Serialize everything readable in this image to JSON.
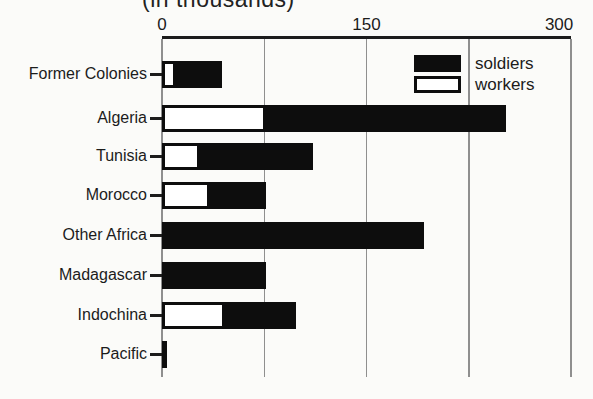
{
  "chart": {
    "title": "(in thousands)",
    "units": "thousands",
    "xtick_labels": [
      "0",
      "150",
      "300"
    ],
    "legend": {
      "items": [
        {
          "label": "soldiers",
          "fill": "#0d0d0d"
        },
        {
          "label": "workers",
          "fill": "#ffffff"
        }
      ]
    },
    "colors": {
      "soldiers": "#0d0d0d",
      "workers": "#ffffff",
      "gridline": "#8f8f8f",
      "axis": "#1c1c1c",
      "text": "#1c1c1c",
      "background": "#fbfbf9"
    }
  },
  "chart_data": {
    "type": "bar",
    "orientation": "horizontal",
    "stacked": true,
    "title": "(in thousands)",
    "categories": [
      "Former Colonies",
      "Algeria",
      "Tunisia",
      "Morocco",
      "Other Africa",
      "Madagascar",
      "Indochina",
      "Pacific"
    ],
    "series": [
      {
        "name": "workers",
        "values": [
          10,
          76,
          28,
          35,
          0,
          4,
          46,
          0
        ]
      },
      {
        "name": "soldiers",
        "values": [
          34,
          176,
          83,
          41,
          192,
          72,
          52,
          4
        ]
      }
    ],
    "xlabel": "",
    "ylabel": "",
    "xlim": [
      0,
      300
    ],
    "xticks": [
      0,
      150,
      300
    ],
    "gridlines": [
      0,
      75,
      150,
      225,
      300
    ],
    "grid": true,
    "legend_position": "top-right",
    "legend_order": [
      "soldiers",
      "workers"
    ]
  }
}
